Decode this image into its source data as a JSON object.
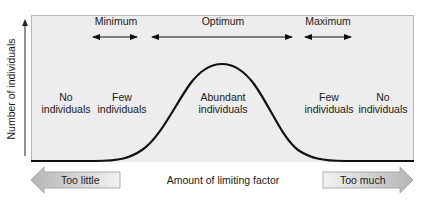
{
  "diagram": {
    "y_axis_label": "Number of individuals",
    "x_axis_label": "Amount of limiting factor",
    "ranges": [
      {
        "label": "Minimum",
        "x_start": 92,
        "x_end": 138
      },
      {
        "label": "Optimum",
        "x_start": 152,
        "x_end": 293
      },
      {
        "label": "Maximum",
        "x_start": 304,
        "x_end": 352
      }
    ],
    "zones": [
      {
        "line1": "No",
        "line2": "individuals"
      },
      {
        "line1": "Few",
        "line2": "individuals"
      },
      {
        "line1": "Abundant",
        "line2": "individuals"
      },
      {
        "line1": "Few",
        "line2": "individuals"
      },
      {
        "line1": "No",
        "line2": "individuals"
      }
    ],
    "bottom_arrows": {
      "left": "Too little",
      "right": "Too much"
    },
    "curve": {
      "shape": "bell",
      "peak_x": 222,
      "baseline_y": 161,
      "peak_y": 64
    },
    "colors": {
      "panel_bg": "#ededed",
      "curve": "#111111",
      "arrow_fill": "#c4c4c4"
    }
  }
}
